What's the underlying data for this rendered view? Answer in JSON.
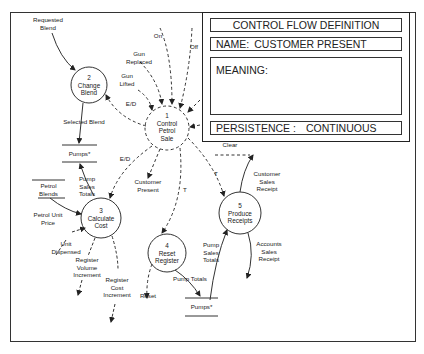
{
  "definition_panel": {
    "title": "CONTROL FLOW DEFINITION",
    "name_label": "NAME:",
    "name_value": "CUSTOMER PRESENT",
    "meaning_label": "MEANING:",
    "meaning_value": "",
    "persistence_label": "PERSISTENCE :",
    "persistence_value": "CONTINUOUS"
  },
  "processes": [
    {
      "number": "1",
      "line1": "Control",
      "line2": "Petrol",
      "line3": "Sale",
      "type": "control"
    },
    {
      "number": "2",
      "line1": "Change",
      "line2": "Blend",
      "type": "data"
    },
    {
      "number": "3",
      "line1": "Calculate",
      "line2": "Cost",
      "type": "data"
    },
    {
      "number": "4",
      "line1": "Reset",
      "line2": "Register",
      "type": "data"
    },
    {
      "number": "5",
      "line1": "Produce",
      "line2": "Receipts",
      "type": "data"
    }
  ],
  "stores": {
    "pumps_top": "Pumps*",
    "pumps_bottom": "Pumps*",
    "petrol_blends_line1": "Petrol",
    "petrol_blends_line2": "Blends"
  },
  "flows": {
    "requested_blend_1": "Requested",
    "requested_blend_2": "Blend",
    "on": "On",
    "off": "Off",
    "gun_replaced_1": "Gun",
    "gun_replaced_2": "Replaced",
    "gun_lifted_1": "Gun",
    "gun_lifted_2": "Lifted",
    "ed_top": "E/D",
    "ed_left": "E/D",
    "selected_blend": "Selected Blend",
    "customer_present_1": "Customer",
    "customer_present_2": "Present",
    "clear": "Clear",
    "t_middle": "T",
    "t_right": "T",
    "pump_sales_totals_left_1": "Pump",
    "pump_sales_totals_left_2": "Sales",
    "pump_sales_totals_left_3": "Totals",
    "petrol_unit_price_1": "Petrol Unit",
    "petrol_unit_price_2": "Price",
    "unit_dispensed_1": "Unit",
    "unit_dispensed_2": "Dispensed",
    "register_volume_increment_1": "Register",
    "register_volume_increment_2": "Volume",
    "register_volume_increment_3": "Increment",
    "register_cost_increment_1": "Register",
    "register_cost_increment_2": "Cost",
    "register_cost_increment_3": "Increment",
    "reset": "Reset",
    "pump_totals": "Pump Totals",
    "pump_sales_totals_right_1": "Pump",
    "pump_sales_totals_right_2": "Sales",
    "pump_sales_totals_right_3": "Totals",
    "customer_sales_receipt_1": "Customer",
    "customer_sales_receipt_2": "Sales",
    "customer_sales_receipt_3": "Receipt",
    "accounts_sales_receipt_1": "Accounts",
    "accounts_sales_receipt_2": "Sales",
    "accounts_sales_receipt_3": "Receipt"
  }
}
